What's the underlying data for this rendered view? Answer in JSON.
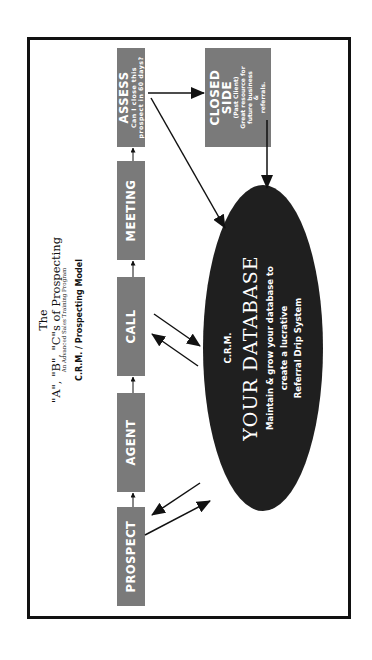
{
  "title": {
    "line1": "The",
    "line2": "\"A\", \"B\", \"C\"s of Prospecting",
    "subtitle": "An Advanced Sales Training Program",
    "model": "C.R.M. / Prospecting Model"
  },
  "flow": [
    {
      "label": "PROSPECT"
    },
    {
      "label": "AGENT"
    },
    {
      "label": "CALL"
    },
    {
      "label": "MEETING"
    },
    {
      "label": "ASSESS",
      "sub1": "Can I close this",
      "sub2": "prospect in 60 days?"
    }
  ],
  "closed": {
    "title1": "CLOSED",
    "title2": "SIDE",
    "sub1": "(Past Client)",
    "sub2": "Great resource for",
    "sub3": "future business",
    "sub4": "&",
    "sub5": "referrals."
  },
  "database": {
    "label": "C.R.M.",
    "title": "YOUR DATABASE",
    "desc1": "Maintain & grow your database to",
    "desc2": "create a lucrative",
    "desc3": "Referral Drip System"
  },
  "colors": {
    "box": "#7a7a7a",
    "ellipse": "#1f1f1f",
    "frame": "#111111"
  },
  "orientation": "rotated -90deg"
}
